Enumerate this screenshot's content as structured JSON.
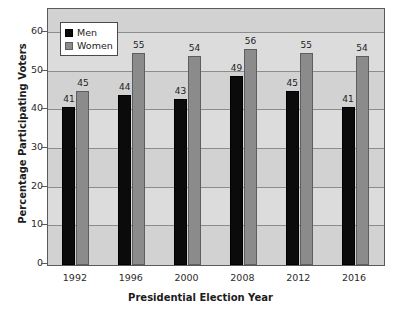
{
  "chart_data": {
    "type": "bar",
    "title": "",
    "subtitle": "",
    "xlabel": "Presidential Election Year",
    "ylabel": "Percentage Participating Voters",
    "categories": [
      "1992",
      "1996",
      "2000",
      "2008",
      "2012",
      "2016"
    ],
    "series": [
      {
        "name": "Men",
        "color": "#0b0b0b",
        "values": [
          41,
          44,
          43,
          49,
          45,
          41
        ]
      },
      {
        "name": "Women",
        "color": "#8b8b8b",
        "values": [
          45,
          55,
          54,
          56,
          55,
          54
        ]
      }
    ],
    "ylim": [
      0,
      66
    ],
    "yticks": [
      0,
      10,
      20,
      30,
      40,
      50,
      60
    ],
    "grid": true,
    "data_labels": true,
    "legend_position": "top-left",
    "plot_background": "#d2d2d2",
    "figure_background": "#ffffff"
  },
  "legend": {
    "items": [
      {
        "label": "Men"
      },
      {
        "label": "Women"
      }
    ]
  }
}
